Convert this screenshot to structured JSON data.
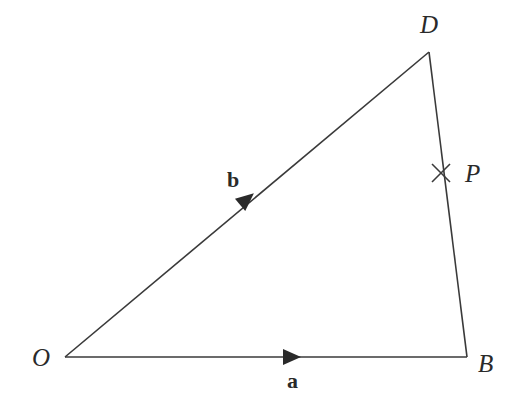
{
  "diagram": {
    "type": "vector-triangle",
    "points": {
      "O": {
        "label": "O"
      },
      "B": {
        "label": "B"
      },
      "D": {
        "label": "D"
      },
      "P": {
        "label": "P",
        "on_segment": "BD",
        "marker": "cross"
      }
    },
    "edges": [
      {
        "from": "O",
        "to": "B",
        "vector_label": "a",
        "arrow": true
      },
      {
        "from": "O",
        "to": "D",
        "vector_label": "b",
        "arrow": true
      },
      {
        "from": "B",
        "to": "D",
        "vector_label": "",
        "arrow": false
      }
    ],
    "colors": {
      "line": "#3a3a3a",
      "text": "#2a2a2a"
    }
  }
}
